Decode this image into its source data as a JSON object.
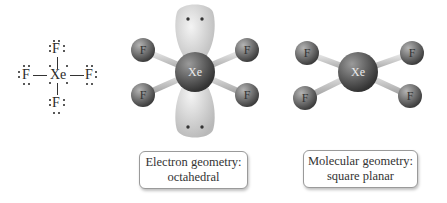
{
  "lewis_structure": {
    "central_atom": "Xe",
    "top_atom": "F",
    "bottom_atom": "F",
    "left_atom": "F",
    "right_atom": "F"
  },
  "electron_geometry_model": {
    "central_atom": "Xe",
    "ligands": [
      "F",
      "F",
      "F",
      "F"
    ],
    "lone_pairs": 2
  },
  "molecular_geometry_model": {
    "central_atom": "Xe",
    "ligands": [
      "F",
      "F",
      "F",
      "F"
    ]
  },
  "labels": {
    "electron_geometry_line1": "Electron geometry:",
    "electron_geometry_line2": "octahedral",
    "molecular_geometry_line1": "Molecular geometry:",
    "molecular_geometry_line2": "square planar"
  },
  "colors": {
    "atom_gray": "#6e6e6e",
    "lobe_gray": "#d6d6d6",
    "bond_gray": "#c9c9c9",
    "box_border": "#9a9a9a"
  }
}
